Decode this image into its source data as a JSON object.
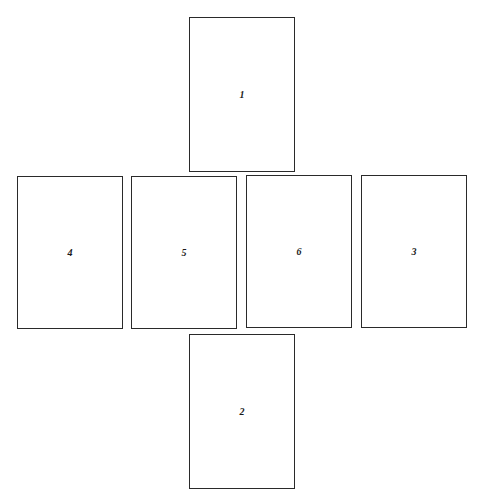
{
  "diagram": {
    "type": "cube-net",
    "panels": [
      {
        "label": "1",
        "position": "top"
      },
      {
        "label": "4",
        "position": "middle-1"
      },
      {
        "label": "5",
        "position": "middle-2"
      },
      {
        "label": "6",
        "position": "middle-3"
      },
      {
        "label": "3",
        "position": "middle-4"
      },
      {
        "label": "2",
        "position": "bottom"
      }
    ]
  }
}
